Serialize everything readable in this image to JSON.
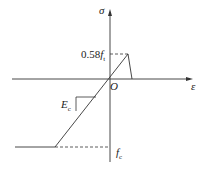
{
  "diagram": {
    "axes": {
      "y_label": "σ",
      "x_label": "ε",
      "origin_label": "O"
    },
    "labels": {
      "tensile_peak_num": "0.58",
      "tensile_peak_sym": "f",
      "tensile_peak_sub": "t",
      "modulus_sym": "E",
      "modulus_sub": "c",
      "compressive_sym": "f",
      "compressive_sub": "c"
    },
    "colors": {
      "line": "#333333",
      "background": "#ffffff"
    }
  }
}
